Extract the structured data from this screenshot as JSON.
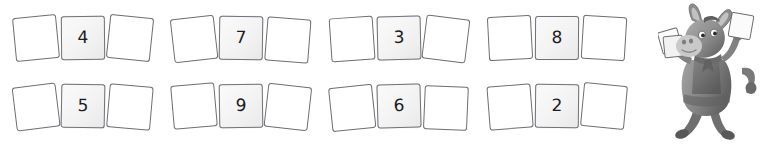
{
  "worksheet": {
    "title": "Number card sets",
    "rows": [
      {
        "row_index": 1,
        "groups": [
          {
            "id": "group-1",
            "number": "4",
            "blank_left": "",
            "blank_right": ""
          },
          {
            "id": "group-2",
            "number": "7",
            "blank_left": "",
            "blank_right": ""
          },
          {
            "id": "group-3",
            "number": "3",
            "blank_left": "",
            "blank_right": ""
          },
          {
            "id": "group-4",
            "number": "8",
            "blank_left": "",
            "blank_right": ""
          }
        ]
      },
      {
        "row_index": 2,
        "groups": [
          {
            "id": "group-5",
            "number": "5",
            "blank_left": "",
            "blank_right": ""
          },
          {
            "id": "group-6",
            "number": "9",
            "blank_left": "",
            "blank_right": ""
          },
          {
            "id": "group-7",
            "number": "6",
            "blank_left": "",
            "blank_right": ""
          },
          {
            "id": "group-8",
            "number": "2",
            "blank_left": "",
            "blank_right": ""
          }
        ]
      }
    ]
  },
  "mascot": {
    "name": "donkey-mascot",
    "description": "Grey cartoon donkey holding number cards in both hands",
    "held_card_left": "",
    "held_card_right": ""
  },
  "colors": {
    "card_border": "#6e6e72",
    "card_blank_fill": "#ffffff",
    "card_number_fill": "#f4f4f4",
    "number_text": "#1d1d1f",
    "mascot_body": "#8c8c8c",
    "mascot_dark": "#5f5f5f",
    "background": "#ffffff"
  }
}
